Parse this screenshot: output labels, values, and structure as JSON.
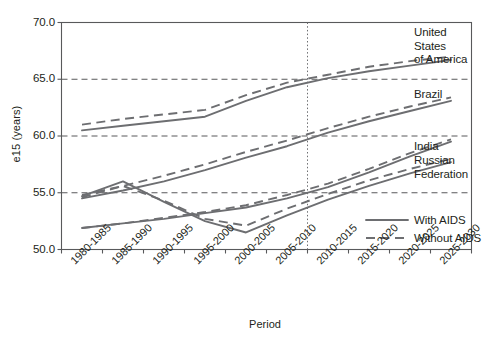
{
  "chart_data": {
    "type": "line",
    "title": "",
    "xlabel": "Period",
    "ylabel": "e15 (years)",
    "ylim": [
      50.0,
      70.0
    ],
    "yticks": [
      50.0,
      55.0,
      60.0,
      65.0,
      70.0
    ],
    "ytick_labels": [
      "50.0",
      "55.0",
      "60.0",
      "65.0",
      "70.0"
    ],
    "grid": "horizontal-dashed-at-55-60-65",
    "legend_position": "lower-right-inside",
    "annotations": {
      "vertical_divider_period": "2010-2015",
      "vertical_divider_note": "dotted vertical line separating estimates from projections"
    },
    "categories": [
      "1980-1985",
      "1985-1990",
      "1990-1995",
      "1995-2000",
      "2000-2005",
      "2005-2010",
      "2010-2015",
      "2015-2020",
      "2020-2025",
      "2025-2030"
    ],
    "series": [
      {
        "name": "United States of America",
        "variant": "With AIDS",
        "style": "solid",
        "values": [
          60.5,
          60.9,
          61.3,
          61.7,
          63.1,
          64.3,
          65.1,
          65.7,
          66.2,
          66.7
        ]
      },
      {
        "name": "United States of America",
        "variant": "Without AIDS",
        "style": "dashed",
        "values": [
          61.0,
          61.5,
          61.9,
          62.3,
          63.6,
          64.7,
          65.4,
          66.1,
          66.6,
          67.0
        ]
      },
      {
        "name": "Brazil",
        "variant": "With AIDS",
        "style": "solid",
        "values": [
          54.5,
          55.2,
          56.0,
          57.0,
          58.1,
          59.1,
          60.3,
          61.3,
          62.2,
          63.1
        ]
      },
      {
        "name": "Brazil",
        "variant": "Without AIDS",
        "style": "dashed",
        "values": [
          54.8,
          55.6,
          56.5,
          57.5,
          58.6,
          59.6,
          60.7,
          61.7,
          62.6,
          63.4
        ]
      },
      {
        "name": "India",
        "variant": "With AIDS",
        "style": "solid",
        "values": [
          51.9,
          52.3,
          52.7,
          53.2,
          53.7,
          54.5,
          55.5,
          56.8,
          58.2,
          59.5
        ]
      },
      {
        "name": "India",
        "variant": "Without AIDS",
        "style": "dashed",
        "values": [
          51.9,
          52.3,
          52.8,
          53.3,
          53.9,
          54.8,
          55.8,
          57.1,
          58.5,
          59.7
        ]
      },
      {
        "name": "Russian Federation",
        "variant": "With AIDS",
        "style": "solid",
        "values": [
          54.7,
          56.0,
          54.2,
          52.5,
          51.5,
          53.0,
          54.4,
          55.6,
          56.7,
          57.7
        ]
      },
      {
        "name": "Russian Federation",
        "variant": "Without AIDS",
        "style": "dashed",
        "values": [
          54.6,
          55.6,
          54.3,
          52.7,
          52.1,
          53.6,
          54.9,
          56.1,
          57.1,
          58.0
        ]
      }
    ],
    "series_labels": [
      {
        "id": "usa",
        "lines": [
          "United",
          "States",
          "of America"
        ]
      },
      {
        "id": "brazil",
        "lines": [
          "Brazil"
        ]
      },
      {
        "id": "india",
        "lines": [
          "India"
        ]
      },
      {
        "id": "russia",
        "lines": [
          "Russian",
          "Federation"
        ]
      }
    ],
    "legend": [
      {
        "label": "With AIDS",
        "style": "solid"
      },
      {
        "label": "Without AIDS",
        "style": "dashed"
      }
    ],
    "colors": {
      "line": "#6d6e71",
      "axis": "#58595b",
      "text": "#231f20",
      "background": "#ffffff"
    }
  }
}
